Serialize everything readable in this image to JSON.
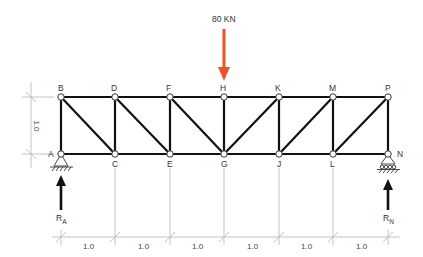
{
  "diagram": {
    "type": "truss",
    "colors": {
      "member": "#111111",
      "dimension": "#aaaaaa",
      "load": "#e8542f",
      "reaction": "#111111",
      "node_fill": "#ffffff"
    },
    "top_nodes": [
      {
        "label": "B",
        "x": 61
      },
      {
        "label": "D",
        "x": 115
      },
      {
        "label": "F",
        "x": 170
      },
      {
        "label": "H",
        "x": 224
      },
      {
        "label": "K",
        "x": 279
      },
      {
        "label": "M",
        "x": 333
      },
      {
        "label": "P",
        "x": 388
      }
    ],
    "bottom_nodes": [
      {
        "label": "A",
        "x": 61
      },
      {
        "label": "C",
        "x": 115
      },
      {
        "label": "E",
        "x": 170
      },
      {
        "label": "G",
        "x": 224
      },
      {
        "label": "J",
        "x": 279
      },
      {
        "label": "L",
        "x": 333
      },
      {
        "label": "N",
        "x": 388
      }
    ],
    "load": {
      "label": "80 KN",
      "node": "H"
    },
    "reactions": [
      {
        "label": "R",
        "sub": "A",
        "node": "A"
      },
      {
        "label": "R",
        "sub": "N",
        "node": "N"
      }
    ],
    "height_dimension": "1.0",
    "span_dimensions": [
      "1.0",
      "1.0",
      "1.0",
      "1.0",
      "1.0",
      "1.0"
    ]
  }
}
